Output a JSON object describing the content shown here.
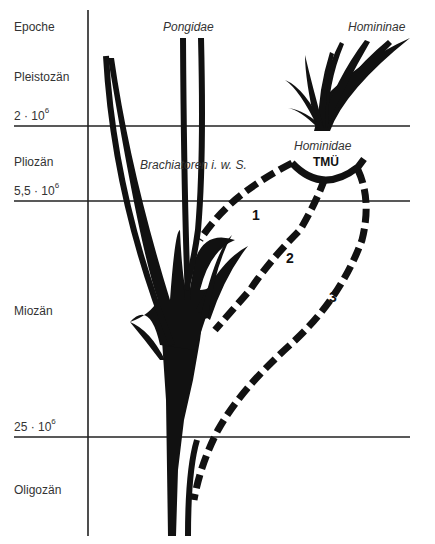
{
  "axis": {
    "header": "Epoche",
    "epochs": [
      {
        "name": "Pleistozän"
      },
      {
        "name": "Pliozän"
      },
      {
        "name": "Miozän"
      },
      {
        "name": "Oligozän"
      }
    ],
    "boundaries": [
      {
        "base": "2 · 10",
        "exp": "6"
      },
      {
        "base": "5,5 · 10",
        "exp": "6"
      },
      {
        "base": "25 · 10",
        "exp": "6"
      }
    ]
  },
  "taxa": {
    "pongidae": "Pongidae",
    "homininae": "Homininae",
    "brachiatoren": "Brachiatoren i. w. S.",
    "hominidae": "Hominidae",
    "tmu": "TMÜ"
  },
  "paths": {
    "path1": "1",
    "path2": "2",
    "path3": "3"
  },
  "colors": {
    "ink": "#111111",
    "line": "#222222",
    "text": "#333333",
    "background": "#ffffff"
  }
}
